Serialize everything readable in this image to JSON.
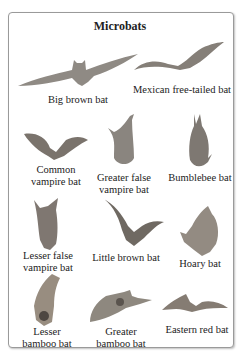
{
  "title": "Microbats",
  "colors": {
    "border": "#9a9a9a",
    "bat_dark": "#6e6a66",
    "bat_mid": "#8f8a84",
    "bat_light": "#b8b2aa"
  },
  "bats": [
    {
      "name": "Big brown bat",
      "lines": [
        "Big brown bat"
      ]
    },
    {
      "name": "Mexican free-tailed bat",
      "lines": [
        "Mexican free-tailed bat"
      ]
    },
    {
      "name": "Common vampire bat",
      "lines": [
        "Common",
        "vampire bat"
      ]
    },
    {
      "name": "Greater false vampire bat",
      "lines": [
        "Greater false",
        "vampire bat"
      ]
    },
    {
      "name": "Bumblebee bat",
      "lines": [
        "Bumblebee bat"
      ]
    },
    {
      "name": "Lesser false vampire bat",
      "lines": [
        "Lesser false",
        "vampire bat"
      ]
    },
    {
      "name": "Little brown bat",
      "lines": [
        "Little brown bat"
      ]
    },
    {
      "name": "Hoary bat",
      "lines": [
        "Hoary bat"
      ]
    },
    {
      "name": "Lesser bamboo bat",
      "lines": [
        "Lesser",
        "bamboo bat"
      ]
    },
    {
      "name": "Greater bamboo bat",
      "lines": [
        "Greater",
        "bamboo bat"
      ]
    },
    {
      "name": "Eastern red bat",
      "lines": [
        "Eastern red bat"
      ]
    }
  ]
}
